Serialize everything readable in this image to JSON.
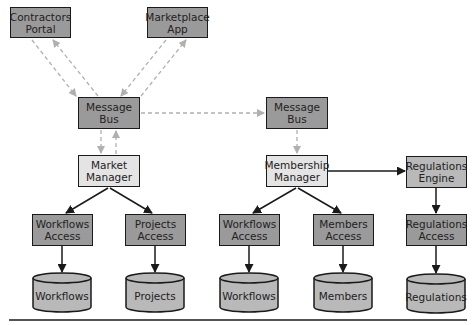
{
  "nodes": {
    "contractors_portal": {
      "label": "Contractors\nPortal",
      "line1": "Contractors",
      "line2": "Portal"
    },
    "marketplace_app": {
      "line1": "Marketplace",
      "line2": "App"
    },
    "message_bus_left": {
      "line1": "Message",
      "line2": "Bus"
    },
    "message_bus_right": {
      "line1": "Message",
      "line2": "Bus"
    },
    "market_manager": {
      "line1": "Market",
      "line2": "Manager"
    },
    "membership_manager": {
      "line1": "Membership",
      "line2": "Manager"
    },
    "regulations_engine": {
      "line1": "Regulations",
      "line2": "Engine"
    },
    "workflows_access_left": {
      "line1": "Workflows",
      "line2": "Access"
    },
    "projects_access": {
      "line1": "Projects",
      "line2": "Access"
    },
    "workflows_access_right": {
      "line1": "Workflows",
      "line2": "Access"
    },
    "members_access": {
      "line1": "Members",
      "line2": "Access"
    },
    "regulations_access": {
      "line1": "Regulations",
      "line2": "Access"
    }
  },
  "databases": {
    "workflows_left": "Workflows",
    "projects": "Projects",
    "workflows_right": "Workflows",
    "members": "Members",
    "regulations": "Regulations"
  },
  "colors": {
    "dark_fill": "#9a9a9a",
    "mid_fill": "#b9b9b9",
    "light_fill": "#e4e4e4",
    "dashed_arrow": "#b0b0b0",
    "solid_arrow": "#1a1a1a"
  }
}
